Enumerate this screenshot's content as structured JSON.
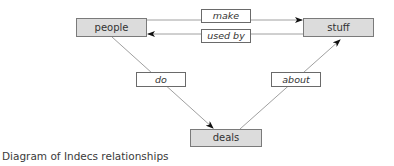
{
  "diagram": {
    "nodes": {
      "people": "people",
      "stuff": "stuff",
      "deals": "deals"
    },
    "relationships": {
      "make": "make",
      "used_by": "used by",
      "do": "do",
      "about": "about"
    },
    "edges": [
      {
        "from": "people",
        "to": "stuff",
        "label": "make"
      },
      {
        "from": "stuff",
        "to": "people",
        "label": "used by"
      },
      {
        "from": "people",
        "to": "deals",
        "label": "do"
      },
      {
        "from": "deals",
        "to": "stuff",
        "label": "about"
      }
    ],
    "colors": {
      "node_fill": "#dcdcdc",
      "node_border": "#7a7a7a",
      "label_fill": "#ffffff",
      "line": "#a0a0a0",
      "arrowhead": "#111111"
    }
  },
  "caption": "Diagram of Indecs relationships"
}
